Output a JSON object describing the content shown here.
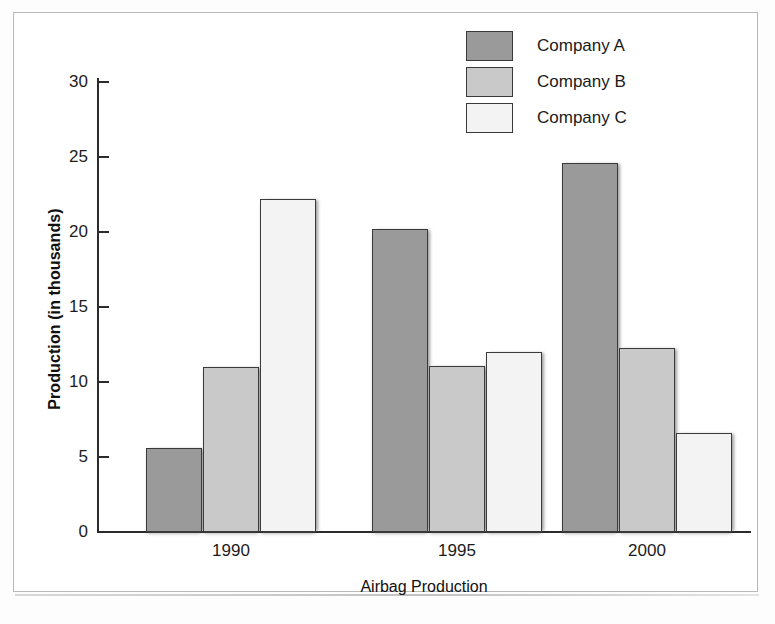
{
  "chart_data": {
    "type": "bar",
    "title": "",
    "xlabel": "Airbag Production",
    "ylabel": "Production (in thousands)",
    "categories": [
      "1990",
      "1995",
      "2000"
    ],
    "series": [
      {
        "name": "Company A",
        "color": "#9a9a9a",
        "values": [
          5.6,
          20.2,
          24.6
        ]
      },
      {
        "name": "Company B",
        "color": "#c9c9c9",
        "values": [
          11.0,
          11.1,
          12.3
        ]
      },
      {
        "name": "Company C",
        "color": "#f3f3f3",
        "values": [
          22.2,
          12.0,
          6.6
        ]
      }
    ],
    "ylim": [
      0,
      30
    ],
    "yticks": [
      0,
      5,
      10,
      15,
      20,
      25,
      30
    ],
    "ytick_labels": [
      "0",
      "5",
      "10",
      "15",
      "20",
      "25",
      "30"
    ],
    "grid": false,
    "legend_position": "top-right"
  },
  "axes": {
    "y_title": "Production (in thousands)",
    "x_title": "Airbag Production"
  },
  "legend": {
    "items": [
      {
        "label": "Company A"
      },
      {
        "label": "Company B"
      },
      {
        "label": "Company C"
      }
    ]
  },
  "colors": {
    "company_a": "#9a9a9a",
    "company_b": "#c9c9c9",
    "company_c": "#f3f3f3",
    "outline": "#3a3a3a",
    "axis": "#2b2b2b",
    "frame": "#b9b9b9"
  }
}
